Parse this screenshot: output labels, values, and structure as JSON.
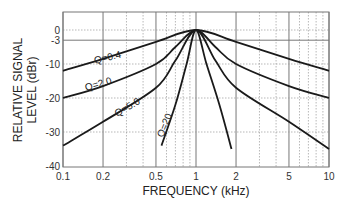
{
  "chart_data": {
    "type": "line",
    "title": "",
    "xlabel": "FREQUENCY (kHz)",
    "ylabel_line1": "RELATIVE SIGNAL",
    "ylabel_line2": "LEVEL (dBr)",
    "xscale": "log",
    "xlim": [
      0.1,
      10
    ],
    "ylim": [
      -40,
      5
    ],
    "x_ticks": [
      "0.1",
      "0.2",
      "0.5",
      "1",
      "2",
      "5",
      "10"
    ],
    "y_ticks": [
      "0",
      "-3",
      "-10",
      "-20",
      "-30",
      "-40"
    ],
    "grid": true,
    "series": [
      {
        "name": "Q=0.4",
        "x": [
          0.1,
          0.2,
          0.5,
          1,
          2,
          5,
          10
        ],
        "values": [
          -12,
          -8.5,
          -3.5,
          0,
          -3.5,
          -8.5,
          -12
        ]
      },
      {
        "name": "Q=2.0",
        "x": [
          0.1,
          0.2,
          0.5,
          0.7,
          1,
          1.4,
          2,
          5,
          10
        ],
        "values": [
          -20,
          -16.5,
          -10,
          -5,
          0,
          -5,
          -10,
          -16.5,
          -20
        ]
      },
      {
        "name": "Q=5.0",
        "x": [
          0.1,
          0.2,
          0.5,
          0.7,
          1,
          1.4,
          2,
          5,
          10
        ],
        "values": [
          -34,
          -27,
          -17,
          -9,
          0,
          -9,
          -17,
          -27,
          -35
        ]
      },
      {
        "name": "Q=20",
        "x": [
          0.55,
          0.7,
          0.85,
          1,
          1.2,
          1.5,
          1.85
        ],
        "values": [
          -34,
          -22,
          -10,
          0,
          -10,
          -22,
          -35
        ]
      }
    ]
  }
}
